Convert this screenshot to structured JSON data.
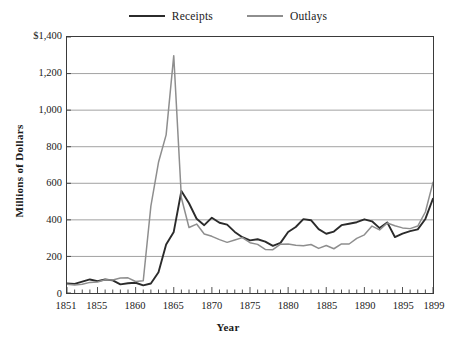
{
  "chart_data": {
    "type": "line",
    "title": "",
    "xlabel": "Year",
    "ylabel": "Millions of Dollars",
    "xlim": [
      1851,
      1899
    ],
    "ylim": [
      0,
      1400
    ],
    "ytick_values": [
      0,
      200,
      400,
      600,
      800,
      1000,
      1200,
      1400
    ],
    "ytick_labels": [
      "0",
      "200",
      "400",
      "600",
      "800",
      "1,000",
      "1,200",
      "$1,400"
    ],
    "xtick_labels": [
      "1851",
      "1855",
      "1860",
      "1865",
      "1870",
      "1875",
      "1880",
      "1885",
      "1890",
      "1895",
      "1899"
    ],
    "xtick_values": [
      1851,
      1855,
      1860,
      1865,
      1870,
      1875,
      1880,
      1885,
      1890,
      1895,
      1899
    ],
    "minor_xticks_every": 1,
    "grid": "horizontal",
    "legend_position": "top-center",
    "x": [
      1851,
      1852,
      1853,
      1854,
      1855,
      1856,
      1857,
      1858,
      1859,
      1860,
      1861,
      1862,
      1863,
      1864,
      1865,
      1866,
      1867,
      1868,
      1869,
      1870,
      1871,
      1872,
      1873,
      1874,
      1875,
      1876,
      1877,
      1878,
      1879,
      1880,
      1881,
      1882,
      1883,
      1884,
      1885,
      1886,
      1887,
      1888,
      1889,
      1890,
      1891,
      1892,
      1893,
      1894,
      1895,
      1896,
      1897,
      1898,
      1899
    ],
    "series": [
      {
        "name": "Receipts",
        "color": "#2b2b2b",
        "values": [
          52,
          50,
          62,
          74,
          65,
          74,
          69,
          47,
          53,
          56,
          42,
          52,
          113,
          265,
          334,
          558,
          491,
          406,
          371,
          412,
          384,
          374,
          334,
          305,
          288,
          294,
          281,
          258,
          274,
          334,
          361,
          404,
          398,
          349,
          324,
          336,
          371,
          379,
          387,
          403,
          392,
          355,
          386,
          306,
          325,
          338,
          348,
          405,
          516
        ]
      },
      {
        "name": "Outlays",
        "color": "#8e8e8e",
        "values": [
          48,
          44,
          48,
          58,
          60,
          72,
          71,
          82,
          83,
          63,
          67,
          475,
          715,
          865,
          1298,
          521,
          358,
          377,
          323,
          310,
          292,
          277,
          290,
          303,
          275,
          266,
          238,
          237,
          267,
          268,
          261,
          258,
          265,
          244,
          260,
          242,
          268,
          268,
          299,
          318,
          366,
          345,
          383,
          368,
          356,
          352,
          366,
          443,
          605
        ]
      }
    ]
  },
  "legend": {
    "items": [
      {
        "label": "Receipts",
        "color": "#2b2b2b"
      },
      {
        "label": "Outlays",
        "color": "#8e8e8e"
      }
    ]
  },
  "axes": {
    "y_title": "Millions of Dollars",
    "x_title": "Year"
  }
}
